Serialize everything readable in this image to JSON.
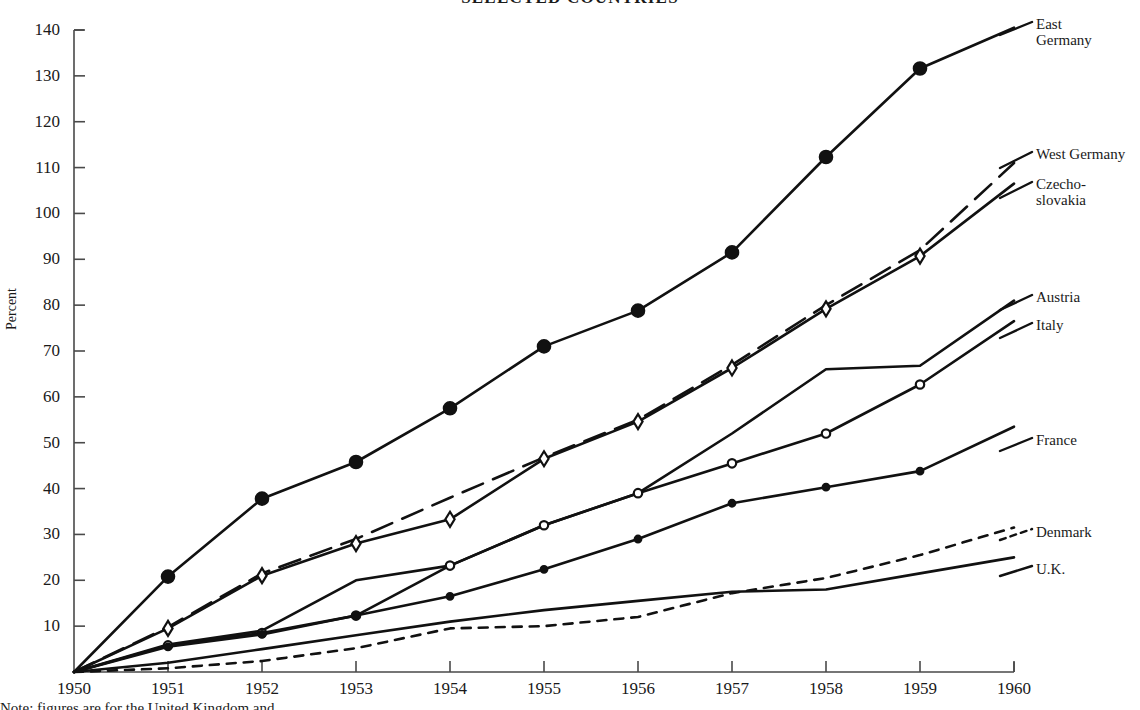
{
  "chart_data": {
    "type": "line",
    "title": "SELECTED COUNTRIES",
    "xlabel": "",
    "ylabel": "Percent",
    "xlim": [
      1950,
      1960
    ],
    "ylim": [
      0,
      140
    ],
    "grid": false,
    "legend_position": "right-of-plot-line-labels",
    "x": [
      1950,
      1951,
      1952,
      1953,
      1954,
      1955,
      1956,
      1957,
      1958,
      1959,
      1960
    ],
    "xtick_labels": [
      "1950",
      "1951",
      "1952",
      "1953",
      "1954",
      "1955",
      "1956",
      "1957",
      "1958",
      "1959",
      "1960"
    ],
    "ytick_labels": [
      "10",
      "20",
      "30",
      "40",
      "50",
      "60",
      "70",
      "80",
      "90",
      "100",
      "110",
      "120",
      "130",
      "140"
    ],
    "ytick_values": [
      10,
      20,
      30,
      40,
      50,
      60,
      70,
      80,
      90,
      100,
      110,
      120,
      130,
      140
    ],
    "series": [
      {
        "name": "East Germany",
        "label": "East\nGermany",
        "marker": "filled-circle-large",
        "line_style": "solid",
        "x": [
          1950,
          1951,
          1952,
          1953,
          1954,
          1955,
          1956,
          1957,
          1958,
          1959,
          1960
        ],
        "values": [
          0,
          20.8,
          37.8,
          45.8,
          57.5,
          71.0,
          78.8,
          91.5,
          112.3,
          131.6,
          140.5
        ]
      },
      {
        "name": "West Germany",
        "label": "West Germany",
        "marker": "none",
        "line_style": "dashed",
        "x": [
          1950,
          1951,
          1952,
          1953,
          1954,
          1955,
          1956,
          1957,
          1958,
          1959,
          1960
        ],
        "values": [
          0,
          9.8,
          21.5,
          29.0,
          38.0,
          46.8,
          55.0,
          67.0,
          80.0,
          92.0,
          111.0
        ]
      },
      {
        "name": "Czechoslovakia",
        "label": "Czecho-\nslovakia",
        "marker": "open-diamond",
        "line_style": "solid",
        "x": [
          1950,
          1951,
          1952,
          1953,
          1954,
          1955,
          1956,
          1957,
          1958,
          1959,
          1960
        ],
        "values": [
          0,
          9.5,
          21.0,
          28.0,
          33.3,
          46.5,
          54.6,
          66.3,
          79.2,
          90.7,
          106.5
        ]
      },
      {
        "name": "Austria",
        "label": "Austria",
        "marker": "none",
        "line_style": "solid",
        "x": [
          1950,
          1951,
          1952,
          1953,
          1954,
          1955,
          1956,
          1957,
          1958,
          1959,
          1960
        ],
        "values": [
          0,
          6.0,
          9.0,
          20.0,
          23.2,
          32.0,
          39.0,
          52.0,
          66.0,
          66.8,
          81.0
        ]
      },
      {
        "name": "Italy",
        "label": "Italy",
        "marker": "open-circle-small",
        "line_style": "solid",
        "x": [
          1950,
          1951,
          1952,
          1953,
          1954,
          1955,
          1956,
          1957,
          1958,
          1959,
          1960
        ],
        "values": [
          0,
          5.8,
          8.5,
          12.3,
          23.2,
          32.0,
          39.0,
          45.5,
          52.0,
          62.7,
          76.5
        ]
      },
      {
        "name": "France",
        "label": "France",
        "marker": "filled-circle-small",
        "line_style": "solid",
        "x": [
          1950,
          1951,
          1952,
          1953,
          1954,
          1955,
          1956,
          1957,
          1958,
          1959,
          1960
        ],
        "values": [
          0,
          5.5,
          8.2,
          12.3,
          16.5,
          22.4,
          29.0,
          36.8,
          40.3,
          43.8,
          53.5
        ]
      },
      {
        "name": "Denmark",
        "label": "Denmark",
        "marker": "none",
        "line_style": "dotted",
        "x": [
          1950,
          1951,
          1952,
          1953,
          1954,
          1955,
          1956,
          1957,
          1958,
          1959,
          1960
        ],
        "values": [
          0,
          0.8,
          2.4,
          5.2,
          9.5,
          10.0,
          12.0,
          17.2,
          20.5,
          25.5,
          31.5
        ]
      },
      {
        "name": "U.K.",
        "label": "U.K.",
        "marker": "none",
        "line_style": "solid",
        "x": [
          1950,
          1951,
          1952,
          1953,
          1954,
          1955,
          1956,
          1957,
          1958,
          1959,
          1960
        ],
        "values": [
          0,
          2.0,
          5.0,
          8.0,
          11.0,
          13.5,
          15.5,
          17.5,
          18.0,
          21.5,
          25.0
        ]
      }
    ]
  },
  "caption": {
    "text": "Note: figures are for the United Kingdom and ..."
  }
}
